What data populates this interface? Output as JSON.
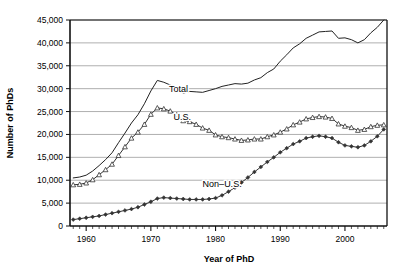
{
  "chart_data": {
    "type": "line",
    "title": "",
    "xlabel": "Year of PhD",
    "ylabel": "Number of PhDs",
    "xlim": [
      1957.5,
      2006.5
    ],
    "ylim": [
      0,
      45000
    ],
    "grid": true,
    "legend_position": "inline-annotations",
    "ytick_labels": [
      "0",
      "5,000",
      "10,000",
      "15,000",
      "20,000",
      "25,000",
      "30,000",
      "35,000",
      "40,000",
      "45,000"
    ],
    "ytick_values": [
      0,
      5000,
      10000,
      15000,
      20000,
      25000,
      30000,
      35000,
      40000,
      45000
    ],
    "xtick_labels": [
      "1960",
      "1970",
      "1980",
      "1990",
      "2000"
    ],
    "xtick_values": [
      1960,
      1970,
      1980,
      1990,
      2000
    ],
    "x": [
      1958,
      1959,
      1960,
      1961,
      1962,
      1963,
      1964,
      1965,
      1966,
      1967,
      1968,
      1969,
      1970,
      1971,
      1972,
      1973,
      1974,
      1975,
      1976,
      1977,
      1978,
      1979,
      1980,
      1981,
      1982,
      1983,
      1984,
      1985,
      1986,
      1987,
      1988,
      1989,
      1990,
      1991,
      1992,
      1993,
      1994,
      1995,
      1996,
      1997,
      1998,
      1999,
      2000,
      2001,
      2002,
      2003,
      2004,
      2005,
      2006
    ],
    "series": [
      {
        "name": "Total",
        "marker": "none",
        "values": [
          10500,
          10700,
          11100,
          12000,
          13200,
          14500,
          16000,
          18200,
          20300,
          22500,
          24300,
          26700,
          29500,
          31800,
          31400,
          30800,
          30200,
          29000,
          29400,
          29300,
          29200,
          29600,
          30000,
          30500,
          30800,
          31100,
          31000,
          31200,
          31900,
          32400,
          33500,
          34300,
          36000,
          37400,
          38900,
          39800,
          41000,
          41700,
          42400,
          42500,
          42600,
          41000,
          41100,
          40700,
          40000,
          40700,
          42200,
          43400,
          45000
        ],
        "color": "#222222"
      },
      {
        "name": "U.S.",
        "marker": "triangle",
        "values": [
          9000,
          9100,
          9400,
          10100,
          11200,
          12300,
          13500,
          15400,
          17300,
          19200,
          20500,
          22200,
          24400,
          25800,
          25600,
          25100,
          24300,
          23000,
          22800,
          22200,
          21400,
          20900,
          19900,
          19500,
          19300,
          19000,
          18700,
          18800,
          19000,
          19000,
          19500,
          19900,
          20500,
          21200,
          22100,
          22700,
          23400,
          23700,
          23900,
          23800,
          23500,
          22300,
          21800,
          21500,
          20900,
          21100,
          21700,
          22000,
          22100
        ],
        "color": "#333333"
      },
      {
        "name": "Non–U.S.",
        "marker": "diamond",
        "values": [
          1400,
          1600,
          1800,
          2000,
          2200,
          2500,
          2800,
          3100,
          3400,
          3700,
          4100,
          4700,
          5300,
          6000,
          6200,
          6100,
          6000,
          5900,
          5800,
          5800,
          5800,
          5900,
          6100,
          6700,
          7500,
          8400,
          9500,
          10600,
          11800,
          12900,
          14000,
          15000,
          16100,
          17000,
          17900,
          18500,
          19200,
          19500,
          19700,
          19500,
          19200,
          18300,
          17600,
          17400,
          17200,
          17600,
          18500,
          19600,
          21100
        ],
        "color": "#333333"
      }
    ],
    "annotations": [
      {
        "text": "Total",
        "x": 1972.8,
        "y": 29200
      },
      {
        "text": "U.S.",
        "x": 1973.5,
        "y": 23200
      },
      {
        "text": "Non–U.S.",
        "x": 1978.0,
        "y": 8600
      }
    ]
  }
}
